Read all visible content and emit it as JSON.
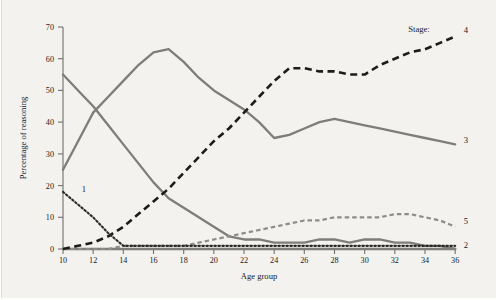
{
  "chart_data": {
    "type": "line",
    "title": "",
    "xlabel": "Age group",
    "ylabel": "Percentage of reasoning",
    "xlim": [
      10,
      36
    ],
    "ylim": [
      0,
      70
    ],
    "xticks": [
      10,
      12,
      14,
      16,
      18,
      20,
      22,
      24,
      26,
      28,
      30,
      32,
      34,
      36
    ],
    "yticks": [
      0,
      10,
      20,
      30,
      40,
      50,
      60,
      70
    ],
    "grid": false,
    "legend_position": "right-inline",
    "legend_caption": "Stage:",
    "x": [
      10,
      11,
      12,
      13,
      14,
      15,
      16,
      17,
      18,
      19,
      20,
      21,
      22,
      23,
      24,
      25,
      26,
      27,
      28,
      29,
      30,
      31,
      32,
      33,
      34,
      35,
      36
    ],
    "series": [
      {
        "name": "1",
        "label": "1",
        "style": "dotted",
        "color": "#2a2a2a",
        "label_side": "left",
        "values": [
          18,
          14,
          10,
          5,
          1,
          1,
          1,
          1,
          1,
          1,
          1,
          1,
          1,
          1,
          1,
          1,
          1,
          1,
          1,
          1,
          1,
          1,
          1,
          1,
          1,
          1,
          1
        ]
      },
      {
        "name": "2",
        "label": "2",
        "style": "solid",
        "color": "#7d7d7a",
        "label_side": "right",
        "values": [
          0,
          0,
          0,
          0,
          0,
          0,
          0,
          0,
          0,
          0,
          0,
          0,
          0,
          0,
          0,
          0,
          0,
          0,
          0,
          0,
          0,
          0,
          0,
          0,
          0,
          0,
          0
        ]
      },
      {
        "name": "3",
        "label": "3",
        "style": "solid",
        "color": "#7d7d7a",
        "label_side": "right",
        "values": [
          25,
          34,
          43,
          48,
          53,
          58,
          62,
          63,
          59,
          54,
          50,
          47,
          44,
          40,
          35,
          36,
          38,
          40,
          41,
          40,
          39,
          38,
          37,
          36,
          35,
          34,
          33
        ]
      },
      {
        "name": "4",
        "label": "4",
        "style": "dashed-black",
        "color": "#1c1c1c",
        "label_side": "right",
        "values": [
          0,
          1,
          2,
          4,
          7,
          11,
          15,
          19,
          24,
          29,
          34,
          38,
          43,
          48,
          53,
          57,
          57,
          56,
          56,
          55,
          55,
          58,
          60,
          62,
          63,
          65,
          67
        ]
      },
      {
        "name": "5",
        "label": "5",
        "style": "dashed-gray",
        "color": "#8d8d8a",
        "label_side": "right",
        "values": [
          0,
          0,
          0,
          0,
          1,
          1,
          1,
          1,
          1,
          2,
          3,
          4,
          5,
          6,
          7,
          8,
          9,
          9,
          10,
          10,
          10,
          10,
          11,
          11,
          10,
          9,
          7
        ]
      },
      {
        "name": "2b",
        "label": "",
        "style": "solid",
        "color": "#7d7d7a",
        "label_side": "none",
        "values": [
          55,
          50,
          45,
          39,
          33,
          27,
          21,
          16,
          13,
          10,
          7,
          4,
          3,
          3,
          2,
          2,
          2,
          3,
          3,
          2,
          3,
          3,
          2,
          2,
          1,
          1,
          0
        ]
      }
    ]
  },
  "labels": {
    "y_axis_title": "Percentage of reasoning",
    "x_axis_title": "Age group",
    "stage_caption": "Stage:",
    "series_1": "1",
    "series_2": "2",
    "series_3": "3",
    "series_4": "4",
    "series_5": "5",
    "ytick_0": "0",
    "ytick_10": "10",
    "ytick_20": "20",
    "ytick_30": "30",
    "ytick_40": "40",
    "ytick_50": "50",
    "ytick_60": "60",
    "ytick_70": "70",
    "xtick_10": "10",
    "xtick_12": "12",
    "xtick_14": "14",
    "xtick_16": "16",
    "xtick_18": "18",
    "xtick_20": "20",
    "xtick_22": "22",
    "xtick_24": "24",
    "xtick_26": "26",
    "xtick_28": "28",
    "xtick_30": "30",
    "xtick_32": "32",
    "xtick_34": "34",
    "xtick_36": "36"
  },
  "colors": {
    "background": "#f3f2ef",
    "axis": "#6f6f6c",
    "gray_series": "#7d7d7a",
    "black_series": "#1c1c1c",
    "gray_dashed_series": "#8d8d8a"
  }
}
